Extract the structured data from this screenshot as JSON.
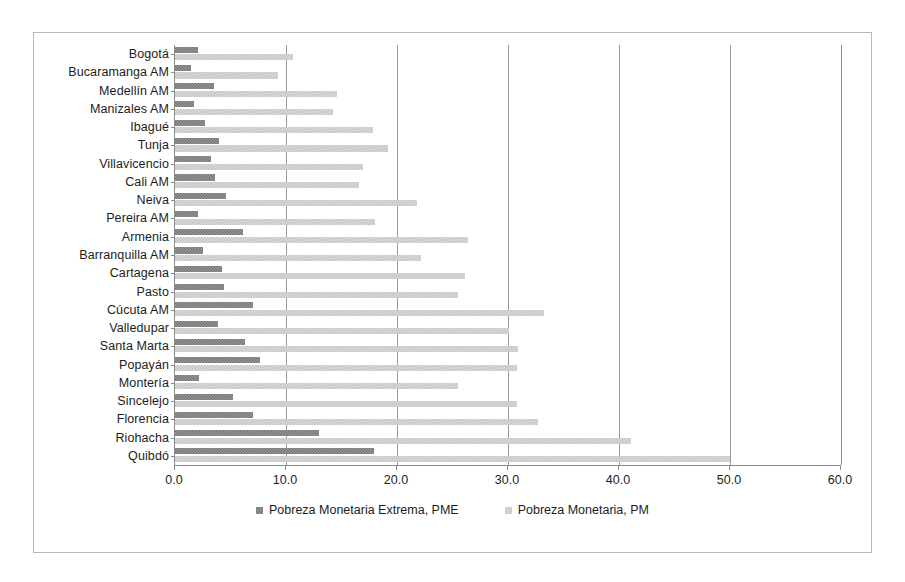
{
  "chart_data": {
    "type": "bar",
    "orientation": "horizontal",
    "title": "",
    "xlabel": "",
    "ylabel": "",
    "xlim": [
      0.0,
      60.0
    ],
    "xticks": [
      "0.0",
      "10.0",
      "20.0",
      "30.0",
      "40.0",
      "50.0",
      "60.0"
    ],
    "xtick_values": [
      0,
      10,
      20,
      30,
      40,
      50,
      60
    ],
    "grid": "vertical",
    "legend_position": "bottom-center",
    "categories": [
      "Bogotá",
      "Bucaramanga AM",
      "Medellín AM",
      "Manizales AM",
      "Ibagué",
      "Tunja",
      "Villavicencio",
      "Cali AM",
      "Neiva",
      "Pereira AM",
      "Armenia",
      "Barranquilla AM",
      "Cartagena",
      "Pasto",
      "Cúcuta AM",
      "Valledupar",
      "Santa Marta",
      "Popayán",
      "Montería",
      "Sincelejo",
      "Florencia",
      "Riohacha",
      "Quibdó"
    ],
    "series": [
      {
        "name": "Pobreza Monetaria Extrema, PME",
        "color": "#727272",
        "values": [
          2.1,
          1.4,
          3.5,
          1.7,
          2.7,
          4.0,
          3.2,
          3.6,
          4.6,
          2.1,
          6.1,
          2.5,
          4.2,
          4.4,
          7.0,
          3.9,
          6.3,
          7.7,
          2.2,
          5.2,
          7.0,
          13.0,
          17.9
        ]
      },
      {
        "name": "Pobreza Monetaria, PM",
        "color": "#c2c2c2",
        "values": [
          10.6,
          9.3,
          14.6,
          14.2,
          17.8,
          19.2,
          16.9,
          16.6,
          21.8,
          18.0,
          26.4,
          22.2,
          26.1,
          25.5,
          33.2,
          30.1,
          30.9,
          30.8,
          25.5,
          30.8,
          32.7,
          41.1,
          50.0
        ]
      }
    ]
  },
  "legend": {
    "items": [
      {
        "label": "Pobreza Monetaria Extrema, PME",
        "swatch": "pme"
      },
      {
        "label": "Pobreza Monetaria, PM",
        "swatch": "pm"
      }
    ]
  }
}
